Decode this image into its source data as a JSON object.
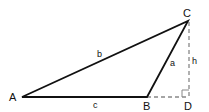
{
  "diagram": {
    "type": "triangle-with-altitude",
    "vertices": {
      "A": {
        "label": "A",
        "x": 22,
        "y": 97
      },
      "B": {
        "label": "B",
        "x": 147,
        "y": 97
      },
      "C": {
        "label": "C",
        "x": 188,
        "y": 21
      },
      "D": {
        "label": "D",
        "x": 189,
        "y": 97
      }
    },
    "sides": {
      "a": {
        "label": "a",
        "from": "B",
        "to": "C"
      },
      "b": {
        "label": "b",
        "from": "A",
        "to": "C"
      },
      "c": {
        "label": "c",
        "from": "A",
        "to": "B"
      }
    },
    "altitude": {
      "label": "h",
      "from": "C",
      "to": "D",
      "style": "dashed"
    },
    "extension": {
      "from": "B",
      "to": "D",
      "style": "dashed"
    },
    "right_angle_at": "D",
    "colors": {
      "solid": "#111111",
      "dashed": "#888888"
    }
  }
}
